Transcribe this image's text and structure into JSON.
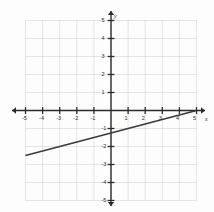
{
  "figure": {
    "background_color": "#fdfdfd",
    "grid_color": "#b8b8b8",
    "axis_color": "#2b2b2b",
    "line_color": "#3a3a3a"
  },
  "axis_names": {
    "x": "x",
    "y": "y"
  },
  "chart_data": {
    "type": "line",
    "title": "",
    "xlabel": "x",
    "ylabel": "y",
    "grid": true,
    "legend": "none",
    "xlim": [
      -5,
      5
    ],
    "ylim": [
      -5,
      5
    ],
    "xticks": [
      -5,
      -4,
      -3,
      -2,
      -1,
      1,
      2,
      3,
      4,
      5
    ],
    "yticks": [
      -5,
      -4,
      -3,
      -2,
      -1,
      1,
      2,
      3,
      4,
      5
    ],
    "xtick_labels": [
      "-5",
      "-4",
      "-3",
      "-2",
      "-1",
      "1",
      "2",
      "3",
      "4",
      "5"
    ],
    "ytick_labels": [
      "-5",
      "-4",
      "-3",
      "-2",
      "-1",
      "1",
      "2",
      "3",
      "4",
      "5"
    ],
    "series": [
      {
        "name": "line",
        "equation": "y = 0.25x - 1.25",
        "slope": 0.25,
        "intercept": -1.25,
        "x": [
          -5,
          5
        ],
        "values": [
          -2.5,
          0
        ],
        "points": [
          [
            -5,
            -2.5
          ],
          [
            5,
            0
          ]
        ]
      }
    ]
  }
}
